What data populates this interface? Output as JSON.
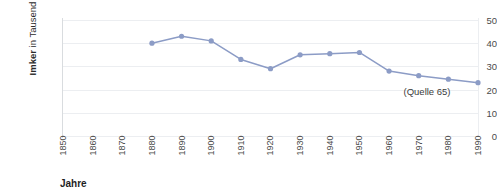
{
  "chart_data": {
    "type": "line",
    "title": "",
    "xlabel": "Jahre",
    "ylabel": "Imker in Tausend",
    "ylabel_bold_part": "Imker",
    "ylabel_rest": " in Tausend",
    "xlim": [
      1850,
      1990
    ],
    "ylim": [
      0,
      50
    ],
    "yticks": [
      50,
      40,
      30,
      20,
      10,
      0
    ],
    "xticks": [
      1850,
      1860,
      1870,
      1880,
      1890,
      1900,
      1910,
      1920,
      1930,
      1940,
      1950,
      1960,
      1970,
      1980,
      1990
    ],
    "grid": true,
    "legend": "none",
    "series": [
      {
        "name": "Imker",
        "color": "#8c9cc6",
        "marker": "circle",
        "x": [
          1880,
          1890,
          1900,
          1910,
          1920,
          1930,
          1940,
          1950,
          1960,
          1970,
          1980,
          1990
        ],
        "values": [
          40,
          43,
          41,
          33,
          29,
          35,
          35.5,
          36,
          28,
          26,
          24.5,
          23
        ]
      }
    ],
    "annotations": [
      {
        "text": "(Quelle 65)",
        "x": 1975,
        "y": 19
      }
    ]
  },
  "colors": {
    "series": "#8c9cc6",
    "grid": "#eceef1",
    "axis": "#d9dcdf",
    "tick_text": "#4b4b4b",
    "title_text": "#1f1f1f",
    "background": "#ffffff"
  }
}
